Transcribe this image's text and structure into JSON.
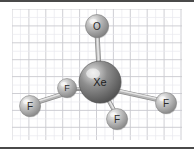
{
  "figure": {
    "background_color": "#ffffff",
    "grid": {
      "major_line_color": "#c9c9cf",
      "minor_line_color": "#e8e8ee",
      "border_color": "#4a4a4a",
      "cell_size": 16.9,
      "area": {
        "x": 12,
        "y": 9,
        "width": 170,
        "height": 131
      }
    },
    "atoms": [
      {
        "id": "atom-o",
        "label": "O",
        "element": "oxygen",
        "cx": 97,
        "cy": 26,
        "r": 11.5,
        "base_color": "#b9b9b9",
        "highlight_color": "#f2f2f2",
        "shadow_color": "#7e7e7e",
        "label_color": "#2b2b2b",
        "font_size": 10
      },
      {
        "id": "atom-xe",
        "label": "Xe",
        "element": "xenon",
        "cx": 100,
        "cy": 82,
        "r": 21,
        "base_color": "#8e8e8e",
        "highlight_color": "#e2e2e2",
        "shadow_color": "#4f4f4f",
        "label_color": "#1c1c1c",
        "font_size": 11
      },
      {
        "id": "atom-f-back",
        "label": "F",
        "element": "fluorine",
        "cx": 67,
        "cy": 88,
        "r": 9.5,
        "base_color": "#bfbfbf",
        "highlight_color": "#f2f2f2",
        "shadow_color": "#828282",
        "label_color": "#2b2b2b",
        "font_size": 9
      },
      {
        "id": "atom-f-left",
        "label": "F",
        "element": "fluorine",
        "cx": 30,
        "cy": 106,
        "r": 10.5,
        "base_color": "#c4c4c4",
        "highlight_color": "#f5f5f5",
        "shadow_color": "#858585",
        "label_color": "#2b2b2b",
        "font_size": 10
      },
      {
        "id": "atom-f-right",
        "label": "F",
        "element": "fluorine",
        "cx": 166,
        "cy": 103,
        "r": 10.5,
        "base_color": "#c4c4c4",
        "highlight_color": "#f5f5f5",
        "shadow_color": "#858585",
        "label_color": "#2b2b2b",
        "font_size": 10
      },
      {
        "id": "atom-f-front",
        "label": "F",
        "element": "fluorine",
        "cx": 117,
        "cy": 119,
        "r": 10.5,
        "base_color": "#c4c4c4",
        "highlight_color": "#f5f5f5",
        "shadow_color": "#858585",
        "label_color": "#2b2b2b",
        "font_size": 10
      }
    ],
    "bonds": [
      {
        "id": "bond-xe-o",
        "from": "Xe",
        "to": "O",
        "x1": 99,
        "y1": 70,
        "x2": 97,
        "y2": 32,
        "width": 5.0,
        "color": "#c2c2c2"
      },
      {
        "id": "bond-xe-f-back",
        "from": "Xe",
        "to": "F",
        "x1": 86,
        "y1": 89,
        "x2": 62,
        "y2": 89,
        "width": 4.2,
        "color": "#9a9a9a"
      },
      {
        "id": "bond-xe-f-left",
        "from": "Xe",
        "to": "F",
        "x1": 70,
        "y1": 92,
        "x2": 35,
        "y2": 103,
        "width": 4.6,
        "color": "#b5b5b5"
      },
      {
        "id": "bond-xe-f-right",
        "from": "Xe",
        "to": "F",
        "x1": 118,
        "y1": 91,
        "x2": 159,
        "y2": 100,
        "width": 4.6,
        "color": "#b5b5b5"
      },
      {
        "id": "bond-xe-f-front",
        "from": "Xe",
        "to": "F",
        "x1": 104,
        "y1": 92,
        "x2": 115,
        "y2": 112,
        "width": 4.2,
        "color": "#bfbfbf"
      }
    ]
  }
}
